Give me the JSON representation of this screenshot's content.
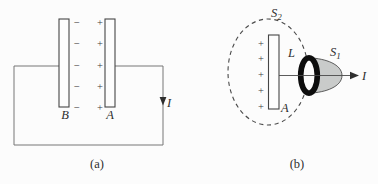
{
  "colors": {
    "background": "#fcfcfc",
    "wire": "#777777",
    "line": "#4a4a4a",
    "text": "#2e2e2e",
    "ring": "#0d0d0d",
    "cap_fill": "#c9cbca"
  },
  "panel_a": {
    "caption": "(a)",
    "plate_left_label": "B",
    "plate_right_label": "A",
    "current_label": "I",
    "minus_sign": "−",
    "plus_sign": "+"
  },
  "panel_b": {
    "caption": "(b)",
    "outer_surface_label_base": "S",
    "outer_surface_label_sub": "2",
    "cap_surface_label_base": "S",
    "cap_surface_label_sub": "1",
    "loop_label": "L",
    "plate_label": "A",
    "current_label": "I",
    "plus_sign": "+"
  }
}
